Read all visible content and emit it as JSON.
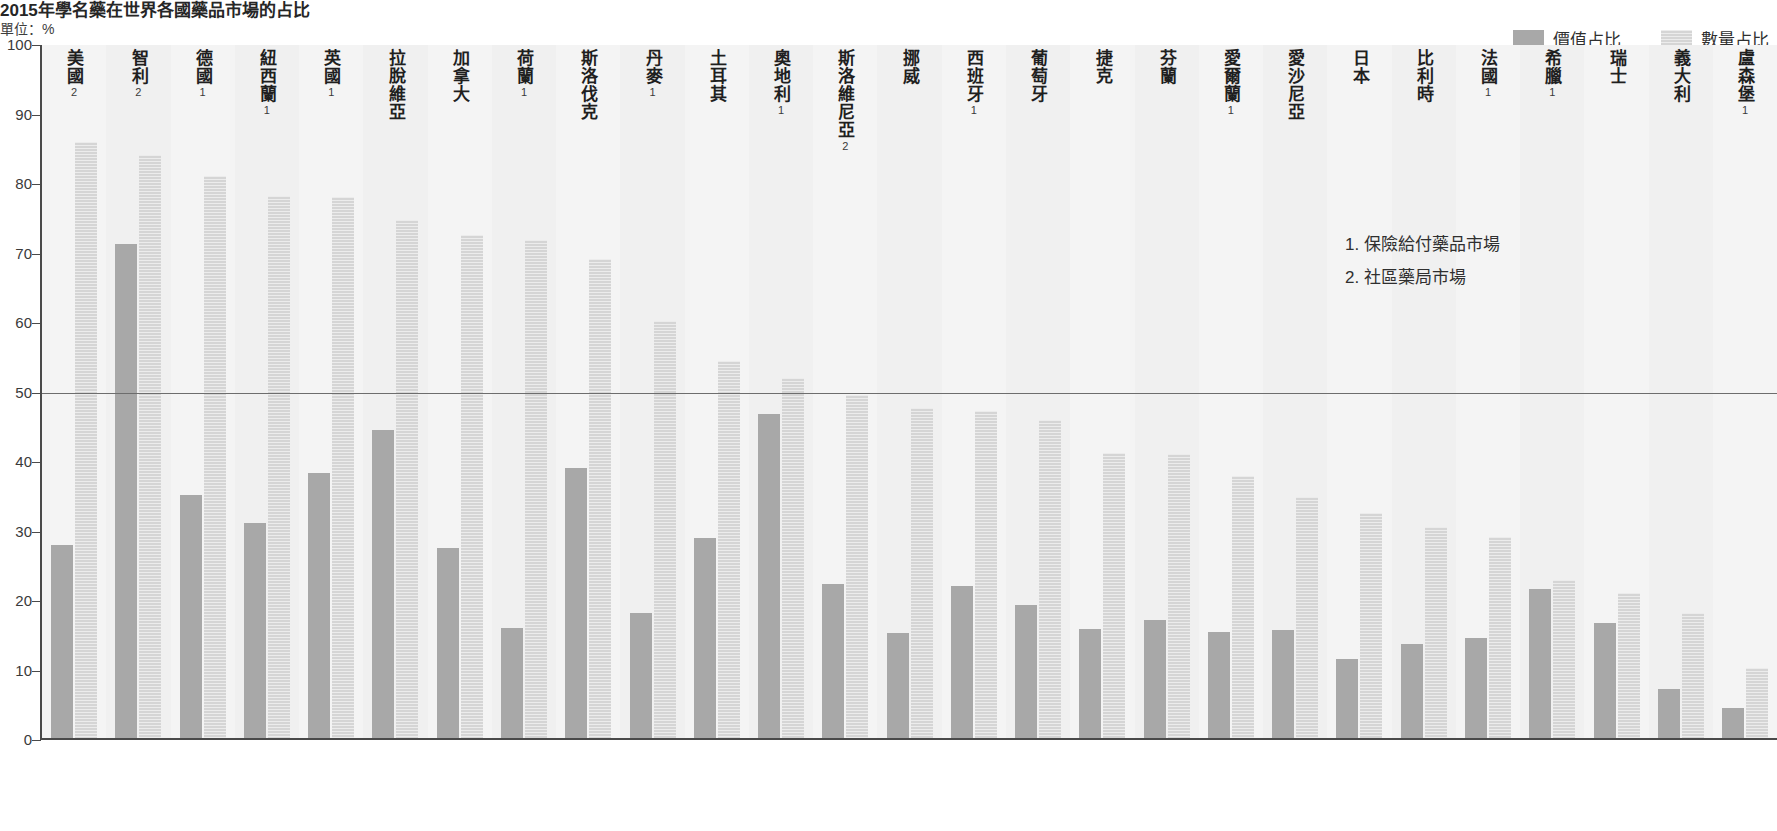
{
  "header": {
    "title": "2015年學名藥在世界各國藥品市場的占比",
    "unit": "單位：%"
  },
  "legend": {
    "position": "top-right",
    "items": [
      {
        "label": "價值占比",
        "color": "#a8a8a8",
        "swatch_name": "legend-swatch-value"
      },
      {
        "label": "數量占比",
        "color": "#d5d5d5",
        "swatch_name": "legend-swatch-volume"
      }
    ]
  },
  "footnotes": [
    "1. 保險給付藥品市場",
    "2. 社區藥局市場"
  ],
  "axis": {
    "ticks": [
      "100",
      "90",
      "80",
      "70",
      "60",
      "50",
      "40",
      "30",
      "20",
      "10",
      "0"
    ],
    "reference_line": 50
  },
  "chart_data": {
    "type": "bar",
    "title": "2015年學名藥在世界各國藥品市場的占比",
    "xlabel": "",
    "ylabel": "單位：%",
    "ylim": [
      0,
      100
    ],
    "yticks": [
      0,
      10,
      20,
      30,
      40,
      50,
      60,
      70,
      80,
      90,
      100
    ],
    "grid": false,
    "reference_lines": [
      50
    ],
    "legend_position": "top-right",
    "categories": [
      "美國",
      "智利",
      "德國",
      "紐西蘭",
      "英國",
      "拉脫維亞",
      "加拿大",
      "荷蘭",
      "斯洛伐克",
      "丹麥",
      "土耳其",
      "奧地利",
      "斯洛維尼亞",
      "挪威",
      "西班牙",
      "葡萄牙",
      "捷克",
      "芬蘭",
      "愛爾蘭",
      "愛沙尼亞",
      "日本",
      "比利時",
      "法國",
      "希臘",
      "瑞士",
      "義大利",
      "盧森堡"
    ],
    "category_notes": [
      "2",
      "2",
      "1",
      "1",
      "1",
      "",
      "",
      "1",
      "",
      "1",
      "",
      "1",
      "2",
      "",
      "1",
      "",
      "",
      "",
      "1",
      "",
      "",
      "",
      "1",
      "1",
      "",
      "",
      "1"
    ],
    "series": [
      {
        "name": "價值占比",
        "color": "#a8a8a8",
        "values": [
          28.0,
          71.3,
          35.3,
          31.2,
          38.4,
          44.6,
          27.7,
          16.1,
          39.2,
          18.3,
          29.0,
          46.9,
          22.5,
          15.4,
          22.1,
          19.4,
          16.0,
          17.3,
          15.5,
          15.8,
          11.7,
          13.8,
          14.7,
          21.8,
          16.9,
          7.3,
          4.6
        ]
      },
      {
        "name": "數量占比",
        "color": "#d5d5d5",
        "values": [
          86.0,
          84.2,
          81.2,
          78.3,
          78.1,
          74.8,
          72.6,
          72.0,
          69.2,
          60.3,
          54.5,
          52.1,
          49.7,
          47.8,
          47.4,
          46.0,
          41.3,
          41.2,
          38.0,
          35.0,
          32.6,
          30.7,
          29.2,
          23.0,
          21.2,
          18.3,
          10.4
        ]
      }
    ]
  }
}
